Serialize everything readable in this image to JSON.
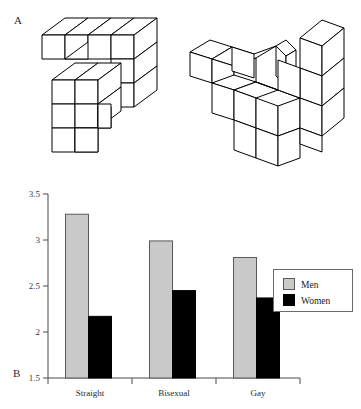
{
  "figure": {
    "panels": [
      {
        "id": "A",
        "label": "A",
        "caption": ""
      },
      {
        "id": "B",
        "label": "B",
        "caption": ""
      }
    ]
  },
  "panel_a": {
    "label": "A",
    "description": "mental-rotation block stimuli",
    "figures": [
      {
        "name": "left-block-figure",
        "orientation": "upright"
      },
      {
        "name": "right-block-figure",
        "orientation": "rotated"
      }
    ]
  },
  "chart_data": {
    "type": "bar",
    "title": "",
    "xlabel": "",
    "ylabel": "",
    "categories": [
      "Straight",
      "Bisexual",
      "Gay"
    ],
    "series": [
      {
        "name": "Men",
        "color": "#c9c9c9",
        "values": [
          3.28,
          2.99,
          2.81
        ]
      },
      {
        "name": "Women",
        "color": "#000000",
        "values": [
          2.17,
          2.45,
          2.37
        ]
      }
    ],
    "ylim": [
      1.5,
      3.5
    ],
    "yticks": [
      1.5,
      2,
      2.5,
      3,
      3.5
    ],
    "ytick_labels": [
      "1.5",
      "2",
      "2.5",
      "3",
      "3.5"
    ],
    "grid": false,
    "legend_position": "right"
  },
  "legend": {
    "entries": [
      {
        "label": "Men",
        "swatch": "gray-swatch"
      },
      {
        "label": "Women",
        "swatch": "black-swatch"
      }
    ]
  }
}
